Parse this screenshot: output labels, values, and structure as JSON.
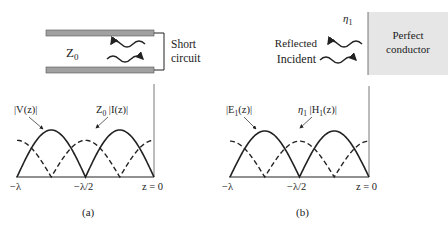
{
  "panel_a": {
    "caption": "(a)",
    "impedance_label": "Z",
    "impedance_sub": "0",
    "short_label_1": "Short",
    "short_label_2": "circuit",
    "v_label": "|V(z)|",
    "i_label_prefix": "Z",
    "i_label_sub": "0",
    "i_label_rest": " |I(z)|",
    "ticks": [
      "−λ",
      "−λ/2",
      "z = 0"
    ]
  },
  "panel_b": {
    "caption": "(b)",
    "eta_label": "η",
    "eta_sub": "1",
    "reflected_label": "Reflected",
    "incident_label": "Incident",
    "conductor_label_1": "Perfect",
    "conductor_label_2": "conductor",
    "e_label_prefix": "|E",
    "e_label_sub": "1",
    "e_label_rest": "(z)|",
    "h_label_prefix": "η",
    "h_label_sub": "1",
    "h_label_mid": " |H",
    "h_label_sub2": "1",
    "h_label_rest": "(z)|",
    "ticks": [
      "−λ",
      "−λ/2",
      "z = 0"
    ]
  },
  "colors": {
    "ink": "#222222",
    "line_fill": "#a0a0a0",
    "conductor_fill": "#e6e6e6"
  }
}
